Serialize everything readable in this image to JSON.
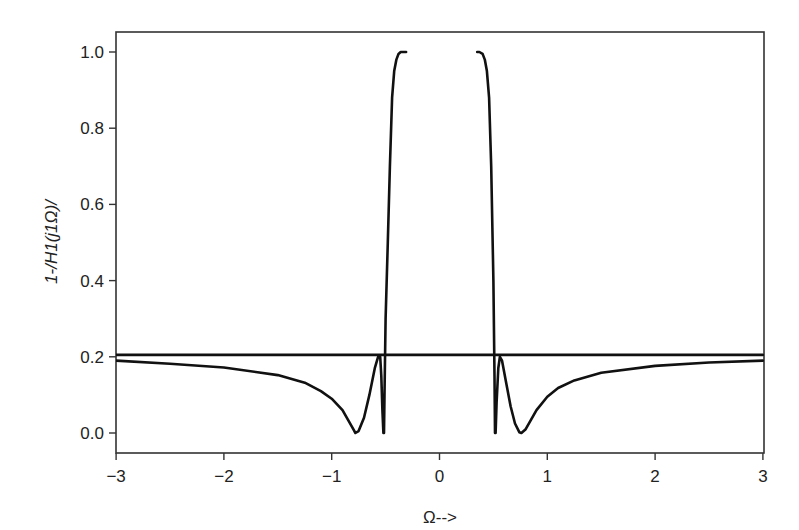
{
  "chart_data": {
    "type": "line",
    "title": "",
    "xlabel": "Ω-->",
    "ylabel": "1-/H1(j1Ω)/",
    "xlim": [
      -3,
      3
    ],
    "ylim": [
      -0.05,
      1.05
    ],
    "grid": false,
    "legend": null,
    "x_ticks": [
      -3,
      -2,
      -1,
      0,
      1,
      2,
      3
    ],
    "x_tick_labels": [
      "−3",
      "−2",
      "−1",
      "0",
      "1",
      "2",
      "3"
    ],
    "y_ticks": [
      0.0,
      0.2,
      0.4,
      0.6,
      0.8,
      1.0
    ],
    "y_tick_labels": [
      "0.0",
      "0.2",
      "0.4",
      "0.6",
      "0.8",
      "1.0"
    ],
    "series": [
      {
        "name": "1-|H1(jΩ)| left branch",
        "color": "#111111",
        "x": [
          -3.0,
          -2.5,
          -2.0,
          -1.5,
          -1.25,
          -1.1,
          -1.0,
          -0.9,
          -0.85,
          -0.8,
          -0.78,
          -0.75,
          -0.7,
          -0.65,
          -0.6,
          -0.57,
          -0.55,
          -0.54,
          -0.53,
          -0.52,
          -0.515,
          -0.51,
          -0.5,
          -0.48,
          -0.46,
          -0.44,
          -0.42,
          -0.4,
          -0.38,
          -0.36,
          -0.34,
          -0.31
        ],
        "y": [
          0.19,
          0.182,
          0.172,
          0.152,
          0.132,
          0.11,
          0.09,
          0.06,
          0.035,
          0.01,
          0.0,
          0.005,
          0.04,
          0.1,
          0.17,
          0.2,
          0.2,
          0.15,
          0.06,
          0.0,
          0.0,
          0.1,
          0.3,
          0.5,
          0.7,
          0.88,
          0.95,
          0.98,
          0.995,
          1.0,
          1.0,
          1.0
        ]
      },
      {
        "name": "1-|H1(jΩ)| right branch",
        "color": "#111111",
        "x": [
          0.35,
          0.37,
          0.4,
          0.42,
          0.44,
          0.46,
          0.48,
          0.5,
          0.51,
          0.515,
          0.52,
          0.53,
          0.545,
          0.56,
          0.58,
          0.62,
          0.66,
          0.7,
          0.74,
          0.76,
          0.8,
          0.85,
          0.9,
          1.0,
          1.1,
          1.25,
          1.5,
          2.0,
          2.5,
          3.0
        ],
        "y": [
          1.0,
          1.0,
          0.995,
          0.98,
          0.95,
          0.88,
          0.7,
          0.4,
          0.15,
          0.0,
          0.0,
          0.08,
          0.17,
          0.2,
          0.19,
          0.13,
          0.07,
          0.025,
          0.002,
          0.0,
          0.01,
          0.035,
          0.06,
          0.095,
          0.118,
          0.138,
          0.158,
          0.176,
          0.185,
          0.19
        ]
      },
      {
        "name": "reference level",
        "color": "#111111",
        "x": [
          -3.0,
          3.0
        ],
        "y": [
          0.205,
          0.205
        ]
      }
    ]
  }
}
